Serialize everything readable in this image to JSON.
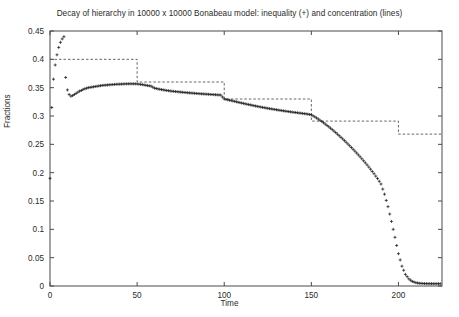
{
  "chart_data": {
    "type": "scatter",
    "title": "Decay of hierarchy in 10000 x 10000 Bonabeau model: inequality (+) and concentration (lines)",
    "xlabel": "Time",
    "ylabel": "Fractions",
    "xlim": [
      0,
      225
    ],
    "ylim": [
      0,
      0.45
    ],
    "grid": false,
    "legend": "none",
    "xticks": [
      0,
      50,
      100,
      150,
      200
    ],
    "xtick_labels": [
      "0",
      "50",
      "100",
      "150",
      "200"
    ],
    "yticks": [
      0,
      0.05,
      0.1,
      0.15,
      0.2,
      0.25,
      0.3,
      0.35,
      0.4,
      0.45
    ],
    "ytick_labels": [
      "0",
      "0.05",
      "0.1",
      "0.15",
      "0.2",
      "0.25",
      "0.3",
      "0.35",
      "0.4",
      "0.45"
    ],
    "series": [
      {
        "name": "inequality (+)",
        "marker": "plus",
        "style": "points",
        "color": "#1a1a1a",
        "x": [
          0,
          1,
          2,
          3,
          4,
          5,
          6,
          7,
          8,
          9,
          10,
          11,
          12,
          13,
          14,
          15,
          16,
          17,
          18,
          19,
          20,
          22,
          24,
          26,
          28,
          30,
          32,
          34,
          36,
          38,
          40,
          42,
          44,
          46,
          48,
          50,
          52,
          54,
          56,
          58,
          60,
          62,
          64,
          66,
          68,
          70,
          72,
          74,
          76,
          78,
          80,
          82,
          84,
          86,
          88,
          90,
          92,
          94,
          96,
          98,
          100,
          102,
          104,
          106,
          108,
          110,
          112,
          114,
          116,
          118,
          120,
          122,
          124,
          126,
          128,
          130,
          132,
          134,
          136,
          138,
          140,
          142,
          144,
          146,
          148,
          150,
          152,
          154,
          156,
          158,
          160,
          162,
          164,
          166,
          168,
          170,
          172,
          174,
          176,
          178,
          180,
          182,
          184,
          186,
          188,
          190,
          192,
          194,
          196,
          198,
          200,
          202,
          204,
          206,
          208,
          210,
          212,
          214,
          216,
          218,
          220,
          222,
          224
        ],
        "y": [
          0.19,
          0.315,
          0.365,
          0.39,
          0.408,
          0.421,
          0.43,
          0.436,
          0.44,
          0.368,
          0.346,
          0.338,
          0.335,
          0.336,
          0.338,
          0.34,
          0.342,
          0.344,
          0.345,
          0.347,
          0.348,
          0.35,
          0.351,
          0.352,
          0.353,
          0.354,
          0.3545,
          0.355,
          0.3555,
          0.356,
          0.3562,
          0.3565,
          0.3567,
          0.3568,
          0.3568,
          0.3566,
          0.3558,
          0.3548,
          0.3537,
          0.3527,
          0.3492,
          0.3478,
          0.3466,
          0.3455,
          0.3446,
          0.3438,
          0.3431,
          0.3425,
          0.3419,
          0.3413,
          0.3408,
          0.3403,
          0.3398,
          0.3393,
          0.3389,
          0.3385,
          0.3381,
          0.3377,
          0.3373,
          0.3369,
          0.33,
          0.3286,
          0.3272,
          0.3258,
          0.3243,
          0.3229,
          0.3215,
          0.3202,
          0.3189,
          0.3176,
          0.3164,
          0.3152,
          0.3141,
          0.313,
          0.312,
          0.311,
          0.31,
          0.3091,
          0.3082,
          0.3073,
          0.3065,
          0.3057,
          0.3049,
          0.3041,
          0.3033,
          0.302,
          0.2985,
          0.2946,
          0.2903,
          0.2858,
          0.281,
          0.276,
          0.2707,
          0.2652,
          0.2595,
          0.2536,
          0.2475,
          0.2412,
          0.2347,
          0.228,
          0.221,
          0.2137,
          0.2061,
          0.1981,
          0.1896,
          0.18,
          0.162,
          0.14,
          0.114,
          0.086,
          0.057,
          0.035,
          0.0205,
          0.0125,
          0.008,
          0.0058,
          0.0048,
          0.0044,
          0.0042,
          0.0041,
          0.004,
          0.004,
          0.004
        ]
      },
      {
        "name": "concentration (lines)",
        "marker": "none",
        "style": "steps-dashed",
        "color": "#555555",
        "step_edges": [
          0,
          50,
          100,
          150,
          200,
          225
        ],
        "step_levels": [
          0.4,
          0.36,
          0.33,
          0.291,
          0.268
        ]
      }
    ]
  },
  "title": {
    "text": "Decay of hierarchy in 10000 x 10000 Bonabeau model: inequality (+) and concentration (lines)"
  },
  "axes": {
    "x_label": "Time",
    "y_label": "Fractions"
  }
}
